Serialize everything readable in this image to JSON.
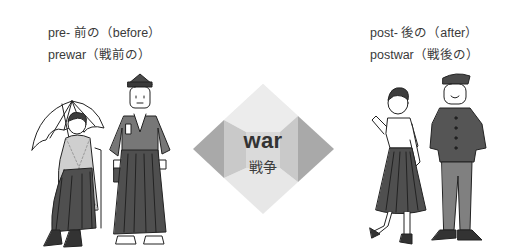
{
  "prefix_before": {
    "line1": "pre- 前の（before）",
    "line2": "prewar（戦前の）"
  },
  "prefix_after": {
    "line1": "post- 後の（after）",
    "line2": "postwar（戦後の）"
  },
  "root_word": {
    "english": "war",
    "japanese": "戦争"
  },
  "colors": {
    "diamond_top": "#ebebeb",
    "diamond_center": "#dcdcdc",
    "diamond_bottom": "#e6e6e6",
    "diamond_sides": "#a9a9a9",
    "diamond_inner_sides": "#c8c8c8",
    "text": "#333333",
    "clothing_dark": "#555555",
    "clothing_mid": "#7a7a7a"
  },
  "illustrations": {
    "left": [
      "seated-woman-with-parasol-in-hakama",
      "man-in-kimono-hakama-and-cap"
    ],
    "right": [
      "woman-in-blouse-and-pleated-skirt",
      "student-in-gakuran-uniform"
    ]
  }
}
